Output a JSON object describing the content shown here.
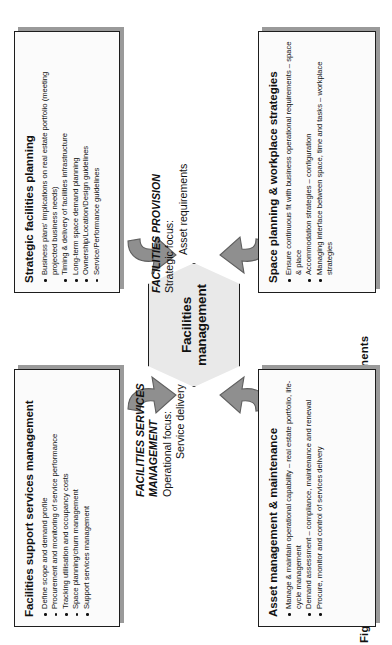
{
  "caption": "Figure 17.6: Facilities management – main components",
  "center": {
    "label_line1": "Facilities",
    "label_line2": "management",
    "shape": "hexagon"
  },
  "focus_labels": [
    {
      "id": "facilities-services-management",
      "title_line1": "FACILITIES SERVICES",
      "title_line2": "MANAGEMENT",
      "subtitle": "Operational focus:",
      "subtitle_value": "Service delivery"
    },
    {
      "id": "facilities-provision",
      "title_line1": "FACILITIES PROVISION",
      "title_line2": "",
      "subtitle": "Strategic focus:",
      "subtitle_value": "Asset requirements"
    }
  ],
  "boxes": [
    {
      "id": "facilities-support-services-management",
      "title": "Facilities support services management",
      "bullets": [
        "Define scope and demand profile",
        "Procurement and monitoring of service performance",
        "Tracking utilisation and occupancy costs",
        "Space planning/churn management",
        "Support services management"
      ]
    },
    {
      "id": "asset-management-maintenance",
      "title": "Asset management & maintenance",
      "bullets": [
        "Manage & maintain operational capability – real estate portfolio, life-cycle management",
        "Demand assessment – compliance, maintenance and renewal",
        "Procure, monitor and control of services delivery"
      ]
    },
    {
      "id": "strategic-facilities-planning",
      "title": "Strategic facilities planning",
      "bullets": [
        "Business plans' implications on real estate portfolio (meeting projected business needs)",
        "Timing & delivery of facilities infrastructure",
        "Long-term space demand planning",
        "Ownership/Location/Design guidelines",
        "Service/Performance guidelines"
      ]
    },
    {
      "id": "space-planning-workplace-strategies",
      "title": "Space planning & workplace strategies",
      "bullets": [
        "Ensure continuous fit with business operational requirements – space & place",
        "Accommodation strategies – configuration",
        "Managing interface between space, time and tasks – workplace strategies"
      ]
    }
  ],
  "arrows": {
    "count": 4,
    "description": "curved arrows pointing inward to the central hexagon",
    "color": "#8f8f8f"
  },
  "colors": {
    "hex_fill": "#e9e9e9",
    "box_fill": "#fbfbfb",
    "border": "#1d1d1d",
    "shadow": "#9a9a9a",
    "text": "#111111"
  }
}
